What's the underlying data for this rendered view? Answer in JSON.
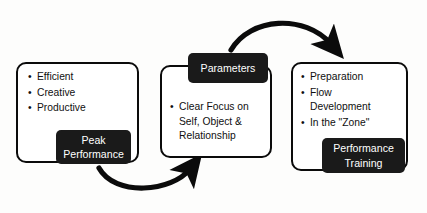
{
  "diagram": {
    "background_color": "#fdfdfc",
    "outline_color": "#0b0b0b",
    "chip_color": "#1a1a1a",
    "chip_text_color": "#ffffff",
    "stages": [
      {
        "id": "peak-performance",
        "label": "Peak\nPerformance",
        "bullets": [
          "Efficient",
          "Creative",
          "Productive"
        ]
      },
      {
        "id": "parameters",
        "label": "Parameters",
        "bullets": [
          "Clear Focus on\nSelf, Object &\nRelationship"
        ]
      },
      {
        "id": "performance-training",
        "label": "Performance\nTraining",
        "bullets": [
          "Preparation",
          "Flow\nDevelopment",
          "In the \"Zone\""
        ]
      }
    ],
    "connectors": [
      {
        "id": "arrow-params-to-training",
        "from": "parameters",
        "to": "performance-training",
        "direction": "clockwise-top"
      },
      {
        "id": "arrow-peak-to-params",
        "from": "peak-performance",
        "to": "parameters",
        "direction": "clockwise-bottom"
      }
    ]
  }
}
